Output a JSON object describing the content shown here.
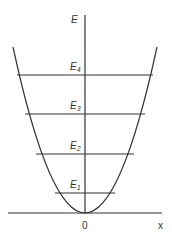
{
  "diagram": {
    "axis_y_label": "E",
    "axis_x_label": "x",
    "origin_label": "0",
    "levels": [
      {
        "base": "E",
        "sub": "4"
      },
      {
        "base": "E",
        "sub": "3"
      },
      {
        "base": "E",
        "sub": "2"
      },
      {
        "base": "E",
        "sub": "1"
      }
    ],
    "colors": {
      "line": "#333333",
      "background": "#ffffff"
    }
  }
}
